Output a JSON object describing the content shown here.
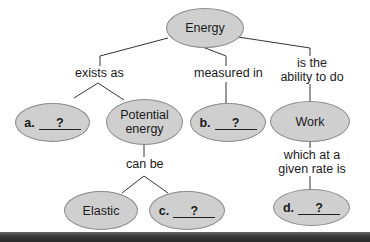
{
  "diagram": {
    "type": "concept-map",
    "root": {
      "label": "Energy"
    },
    "links": {
      "exists_as": "exists as",
      "measured_in": "measured in",
      "ability_line1": "is the",
      "ability_line2": "ability to do",
      "can_be": "can be",
      "rate_line1": "which at a",
      "rate_line2": "given rate is"
    },
    "nodes": {
      "a": {
        "letter": "a.",
        "blank": "?"
      },
      "potential_line1": "Potential",
      "potential_line2": "energy",
      "b": {
        "letter": "b.",
        "blank": "?"
      },
      "work": "Work",
      "elastic": "Elastic",
      "c": {
        "letter": "c.",
        "blank": "?"
      },
      "d": {
        "letter": "d.",
        "blank": "?"
      }
    },
    "colors": {
      "node_fill": "#cfcfcf",
      "node_border": "#8a8a8a",
      "line": "#333333",
      "bottom_bar": "#2a2a2a"
    }
  }
}
